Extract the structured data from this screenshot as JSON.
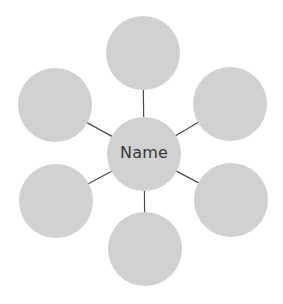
{
  "diagram": {
    "type": "bubble-map",
    "center": {
      "label": "Name",
      "cx": 144,
      "cy": 154,
      "r": 37
    },
    "nodes": [
      {
        "position": "top",
        "label": "",
        "cx": 143,
        "cy": 53,
        "r": 37
      },
      {
        "position": "upper-left",
        "label": "",
        "cx": 55,
        "cy": 105,
        "r": 37
      },
      {
        "position": "upper-right",
        "label": "",
        "cx": 230,
        "cy": 104,
        "r": 37
      },
      {
        "position": "lower-left",
        "label": "",
        "cx": 56,
        "cy": 201,
        "r": 37
      },
      {
        "position": "lower-right",
        "label": "",
        "cx": 231,
        "cy": 200,
        "r": 37
      },
      {
        "position": "bottom",
        "label": "",
        "cx": 145,
        "cy": 249,
        "r": 37
      }
    ],
    "colors": {
      "circle_fill": "#d1d1d1",
      "connector": "#4a4a4a",
      "text": "#3a3a3a",
      "background": "#ffffff"
    }
  }
}
